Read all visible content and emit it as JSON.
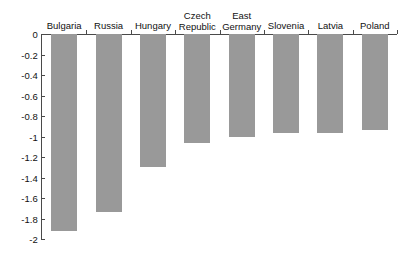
{
  "chart_data": {
    "type": "bar",
    "title": "",
    "subtitle": "",
    "xlabel": "",
    "ylabel": "",
    "categories": [
      "Bulgaria",
      "Russia",
      "Hungary",
      "Czech\nRepublic",
      "East\nGermany",
      "Slovenia",
      "Latvia",
      "Poland"
    ],
    "values": [
      -1.92,
      -1.74,
      -1.3,
      -1.06,
      -1.0,
      -0.97,
      -0.97,
      -0.94
    ],
    "ylim": [
      -2,
      0
    ],
    "ytick_labels": [
      "0",
      "-0.2",
      "-0.4",
      "-0.6",
      "-0.8",
      "-1",
      "-1.2",
      "-1.4",
      "-1.6",
      "-1.8",
      "-2"
    ],
    "ytick_values": [
      0,
      -0.2,
      -0.4,
      -0.6,
      -0.8,
      -1,
      -1.2,
      -1.4,
      -1.6,
      -1.8,
      -2
    ],
    "grid": false,
    "legend": null,
    "legend_position": "none",
    "bar_color": "#999999",
    "axis_color": "#4a4a4a",
    "background_color": "#ffffff",
    "x_axis_position": "top",
    "annotations": []
  }
}
